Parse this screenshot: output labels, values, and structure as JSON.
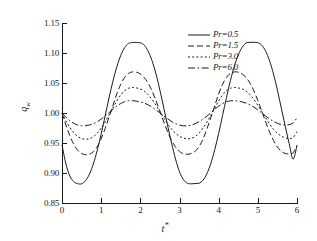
{
  "chart_data": {
    "type": "line",
    "title": "",
    "xlabel": "t*",
    "ylabel": "q",
    "ylabel_sub": "w",
    "xlim": [
      0,
      6
    ],
    "ylim": [
      0.85,
      1.15
    ],
    "xticks": [
      "0",
      "1",
      "2",
      "3",
      "4",
      "5",
      "6"
    ],
    "xtick_values": [
      0,
      1,
      2,
      3,
      4,
      5,
      6
    ],
    "yticks": [
      "0.85",
      "0.90",
      "0.95",
      "1.00",
      "1.05",
      "1.10",
      "1.15"
    ],
    "ytick_values": [
      0.85,
      0.9,
      0.95,
      1.0,
      1.05,
      1.1,
      1.15
    ],
    "grid": false,
    "legend_position": "top-right",
    "series": [
      {
        "name": "Pr=0.5",
        "label_prefix": "Pr",
        "label_value": "0.5",
        "dash": "solid",
        "color": "#1a1a1a",
        "x": [
          0.0,
          0.1,
          0.2,
          0.3,
          0.4,
          0.5,
          0.6,
          0.7,
          0.8,
          0.9,
          1.0,
          1.1,
          1.2,
          1.3,
          1.4,
          1.5,
          1.6,
          1.7,
          1.8,
          1.9,
          2.0,
          2.1,
          2.2,
          2.3,
          2.4,
          2.5,
          2.6,
          2.7,
          2.8,
          2.9,
          3.0,
          3.1,
          3.2,
          3.3,
          3.4,
          3.5,
          3.6,
          3.7,
          3.8,
          3.9,
          4.0,
          4.1,
          4.2,
          4.3,
          4.4,
          4.5,
          4.6,
          4.7,
          4.8,
          4.9,
          5.0,
          5.1,
          5.2,
          5.3,
          5.4,
          5.5,
          5.6,
          5.7,
          5.8,
          5.9,
          6.0
        ],
        "y": [
          0.947,
          0.915,
          0.895,
          0.8855,
          0.8822,
          0.882,
          0.887,
          0.898,
          0.915,
          0.938,
          0.965,
          0.995,
          1.025,
          1.053,
          1.077,
          1.096,
          1.109,
          1.116,
          1.1175,
          1.1175,
          1.117,
          1.113,
          1.103,
          1.087,
          1.065,
          1.038,
          1.008,
          0.978,
          0.949,
          0.923,
          0.902,
          0.889,
          0.883,
          0.882,
          0.8825,
          0.883,
          0.888,
          0.899,
          0.916,
          0.939,
          0.966,
          0.996,
          1.026,
          1.054,
          1.078,
          1.0965,
          1.1095,
          1.1165,
          1.1178,
          1.1178,
          1.1172,
          1.113,
          1.103,
          1.087,
          1.065,
          1.038,
          1.008,
          0.978,
          0.949,
          0.923,
          0.946
        ]
      },
      {
        "name": "Pr=1.5",
        "label_prefix": "Pr",
        "label_value": "1.5",
        "dash": "dashed",
        "color": "#1a1a1a",
        "x": [
          0.0,
          0.1,
          0.2,
          0.3,
          0.4,
          0.5,
          0.6,
          0.7,
          0.8,
          0.9,
          1.0,
          1.1,
          1.2,
          1.3,
          1.4,
          1.5,
          1.6,
          1.7,
          1.8,
          1.9,
          2.0,
          2.1,
          2.2,
          2.3,
          2.4,
          2.5,
          2.6,
          2.7,
          2.8,
          2.9,
          3.0,
          3.1,
          3.2,
          3.3,
          3.4,
          3.5,
          3.6,
          3.7,
          3.8,
          3.9,
          4.0,
          4.1,
          4.2,
          4.3,
          4.4,
          4.5,
          4.6,
          4.7,
          4.8,
          4.9,
          5.0,
          5.1,
          5.2,
          5.3,
          5.4,
          5.5,
          5.6,
          5.7,
          5.8,
          5.9,
          6.0
        ],
        "y": [
          1.0,
          0.98,
          0.962,
          0.948,
          0.938,
          0.9325,
          0.9305,
          0.9312,
          0.9355,
          0.944,
          0.957,
          0.974,
          0.993,
          1.0125,
          1.032,
          1.048,
          1.0595,
          1.066,
          1.0685,
          1.068,
          1.065,
          1.059,
          1.0495,
          1.0365,
          1.0205,
          1.003,
          0.985,
          0.968,
          0.954,
          0.943,
          0.936,
          0.932,
          0.9312,
          0.9325,
          0.9362,
          0.944,
          0.9565,
          0.9735,
          0.9925,
          1.012,
          1.0318,
          1.0478,
          1.0595,
          1.066,
          1.0685,
          1.068,
          1.065,
          1.0592,
          1.0498,
          1.0368,
          1.0208,
          1.0032,
          0.9852,
          0.9682,
          0.9542,
          0.9432,
          0.9362,
          0.9326,
          0.9318,
          0.9335,
          0.946
        ]
      },
      {
        "name": "Pr=3.0",
        "label_prefix": "Pr",
        "label_value": "3.0",
        "dash": "dotted",
        "color": "#1a1a1a",
        "x": [
          0.0,
          0.1,
          0.2,
          0.3,
          0.4,
          0.5,
          0.6,
          0.7,
          0.8,
          0.9,
          1.0,
          1.1,
          1.2,
          1.3,
          1.4,
          1.5,
          1.6,
          1.7,
          1.8,
          1.9,
          2.0,
          2.1,
          2.2,
          2.3,
          2.4,
          2.5,
          2.6,
          2.7,
          2.8,
          2.9,
          3.0,
          3.1,
          3.2,
          3.3,
          3.4,
          3.5,
          3.6,
          3.7,
          3.8,
          3.9,
          4.0,
          4.1,
          4.2,
          4.3,
          4.4,
          4.5,
          4.6,
          4.7,
          4.8,
          4.9,
          5.0,
          5.1,
          5.2,
          5.3,
          5.4,
          5.5,
          5.6,
          5.7,
          5.8,
          5.9,
          6.0
        ],
        "y": [
          1.0,
          0.987,
          0.976,
          0.9672,
          0.961,
          0.9575,
          0.9562,
          0.9572,
          0.9605,
          0.9665,
          0.9748,
          0.985,
          0.9965,
          1.0085,
          1.02,
          1.03,
          1.0372,
          1.0412,
          1.0425,
          1.0418,
          1.04,
          1.0365,
          1.0305,
          1.0225,
          1.013,
          1.0025,
          0.9918,
          0.9818,
          0.973,
          0.966,
          0.9612,
          0.9582,
          0.957,
          0.9578,
          0.9608,
          0.9665,
          0.9748,
          0.985,
          0.9965,
          1.0085,
          1.02,
          1.03,
          1.0372,
          1.0412,
          1.0425,
          1.0418,
          1.04,
          1.0365,
          1.0305,
          1.0225,
          1.013,
          1.0025,
          0.9918,
          0.9818,
          0.973,
          0.9662,
          0.9615,
          0.9585,
          0.9575,
          0.959,
          0.969
        ]
      },
      {
        "name": "Pr=6.0",
        "label_prefix": "Pr",
        "label_value": "6.0",
        "dash": "dashdot",
        "color": "#1a1a1a",
        "x": [
          0.0,
          0.1,
          0.2,
          0.3,
          0.4,
          0.5,
          0.6,
          0.7,
          0.8,
          0.9,
          1.0,
          1.1,
          1.2,
          1.3,
          1.4,
          1.5,
          1.6,
          1.7,
          1.8,
          1.9,
          2.0,
          2.1,
          2.2,
          2.3,
          2.4,
          2.5,
          2.6,
          2.7,
          2.8,
          2.9,
          3.0,
          3.1,
          3.2,
          3.3,
          3.4,
          3.5,
          3.6,
          3.7,
          3.8,
          3.9,
          4.0,
          4.1,
          4.2,
          4.3,
          4.4,
          4.5,
          4.6,
          4.7,
          4.8,
          4.9,
          5.0,
          5.1,
          5.2,
          5.3,
          5.4,
          5.5,
          5.6,
          5.7,
          5.8,
          5.9,
          6.0
        ],
        "y": [
          1.0,
          0.993,
          0.9872,
          0.9828,
          0.98,
          0.9788,
          0.9788,
          0.98,
          0.9822,
          0.9855,
          0.9898,
          0.9948,
          1.0005,
          1.0062,
          1.0115,
          1.0158,
          1.0188,
          1.0203,
          1.0205,
          1.0198,
          1.0185,
          1.0165,
          1.0135,
          1.0098,
          1.0052,
          1.0002,
          0.995,
          0.9902,
          0.9858,
          0.9822,
          0.9798,
          0.9786,
          0.9786,
          0.9798,
          0.9822,
          0.9855,
          0.9898,
          0.9948,
          1.0005,
          1.0062,
          1.0115,
          1.0158,
          1.0188,
          1.0203,
          1.0205,
          1.0198,
          1.0185,
          1.0165,
          1.0135,
          1.0098,
          1.0052,
          1.0002,
          0.995,
          0.9902,
          0.986,
          0.9828,
          0.9806,
          0.9798,
          0.9806,
          0.9835,
          0.992
        ]
      }
    ]
  }
}
